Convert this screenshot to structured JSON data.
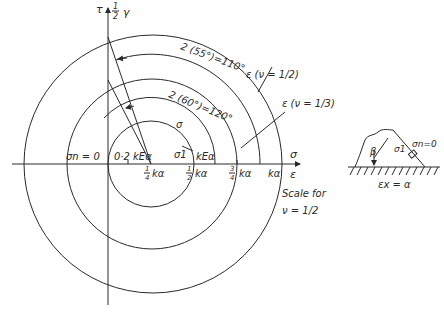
{
  "axes": {
    "vertical_label_tau": "τ",
    "vertical_label_half": "1",
    "vertical_label_half_den": "2",
    "vertical_label_gamma": "γ",
    "horizontal_label_sigma": "σ",
    "horizontal_label_epsilon": "ε"
  },
  "tick_labels": {
    "quarter_num": "1",
    "quarter_den": "4",
    "quarter_unit": "kα",
    "half_num": "1",
    "half_den": "2",
    "half_unit": "kα",
    "threequarter_num": "3",
    "threequarter_den": "4",
    "threequarter_unit": "kα",
    "full": "kα"
  },
  "annotations": {
    "sigma_n_zero": "σn = 0",
    "stress_02": "0·2 kEα",
    "sigma1": "σ1",
    "kEalpha": "kEα",
    "sigma_circle": "σ",
    "angle_120": "2 (60°)=120°",
    "angle_110": "2 (55°)=110°",
    "eps_nu_half": "ε (ν = 1/2)",
    "eps_nu_third": "ε (ν = 1/3)",
    "scale_for": "Scale for",
    "scale_nu": "ν = 1/2"
  },
  "inset": {
    "beta": "β",
    "sigma1": "σ1",
    "sigma_n": "σn=0",
    "strain": "εx = α"
  }
}
